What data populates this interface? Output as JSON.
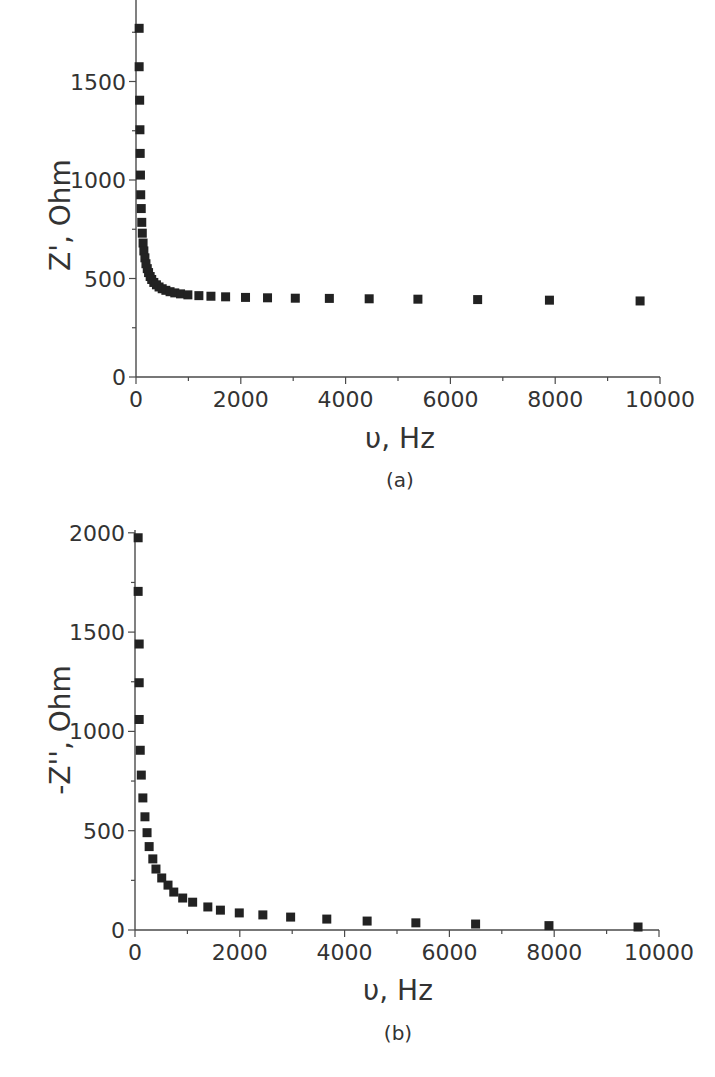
{
  "chart_data": [
    {
      "type": "scatter",
      "panel": "(a)",
      "caption": "(a)",
      "xlabel": "υ, Hz",
      "ylabel": "Z', Ohm",
      "xlim": [
        0,
        10000
      ],
      "ylim": [
        0,
        1900
      ],
      "xticks": [
        0,
        2000,
        4000,
        6000,
        8000,
        10000
      ],
      "yticks": [
        0,
        500,
        1000,
        1500
      ],
      "grid": false,
      "legend": null,
      "marker": "square",
      "color": "#222222",
      "x": [
        60,
        60,
        70,
        75,
        80,
        85,
        90,
        100,
        110,
        120,
        135,
        150,
        170,
        190,
        215,
        240,
        270,
        300,
        340,
        390,
        440,
        500,
        570,
        650,
        740,
        850,
        990,
        1200,
        1430,
        1710,
        2090,
        2510,
        3040,
        3690,
        4450,
        5380,
        6520,
        7890,
        9620
      ],
      "y": [
        1770,
        1575,
        1405,
        1255,
        1135,
        1025,
        925,
        855,
        785,
        730,
        680,
        640,
        605,
        575,
        550,
        530,
        510,
        495,
        480,
        468,
        457,
        448,
        440,
        433,
        427,
        422,
        417,
        413,
        410,
        407,
        404,
        402,
        400,
        399,
        397,
        395,
        393,
        390,
        386
      ]
    },
    {
      "type": "scatter",
      "panel": "(b)",
      "caption": "(b)",
      "xlabel": "υ, Hz",
      "ylabel": "-Z'', Ohm",
      "xlim": [
        0,
        10000
      ],
      "ylim": [
        0,
        2000
      ],
      "xticks": [
        0,
        2000,
        4000,
        6000,
        8000,
        10000
      ],
      "yticks": [
        0,
        500,
        1000,
        1500,
        2000
      ],
      "grid": false,
      "legend": null,
      "marker": "square",
      "color": "#222222",
      "x": [
        60,
        60,
        80,
        80,
        80,
        100,
        120,
        150,
        190,
        230,
        270,
        340,
        400,
        510,
        630,
        740,
        910,
        1100,
        1390,
        1630,
        1990,
        2440,
        2970,
        3660,
        4430,
        5360,
        6500,
        7900,
        9600
      ],
      "y": [
        1975,
        1705,
        1440,
        1245,
        1060,
        905,
        780,
        665,
        570,
        490,
        420,
        358,
        307,
        262,
        226,
        191,
        161,
        140,
        116,
        100,
        86,
        76,
        65,
        55,
        45,
        36,
        30,
        22,
        15
      ]
    }
  ]
}
